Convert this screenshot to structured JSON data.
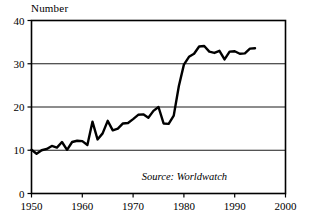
{
  "chart_data": {
    "type": "line",
    "title": "Number",
    "xlabel": "",
    "ylabel": "Number",
    "xlim": [
      1950,
      2000
    ],
    "ylim": [
      0,
      40
    ],
    "xticks": [
      1950,
      1960,
      1970,
      1980,
      1990,
      2000
    ],
    "yticks": [
      0,
      10,
      20,
      30,
      40
    ],
    "xtick_labels": [
      "1950",
      "1960",
      "1970",
      "1980",
      "1990",
      "2000"
    ],
    "ytick_labels": [
      "0",
      "10",
      "20",
      "30",
      "40"
    ],
    "grid": "horizontal",
    "legend": "none",
    "annotations": [
      {
        "name": "source-note",
        "text": "Source: Worldwatch",
        "x": 1988.5,
        "y": 3.2,
        "style": "italic"
      }
    ],
    "series": [
      {
        "name": "Number",
        "color": "#000000",
        "line_width": 2.4,
        "x": [
          1950,
          1951,
          1952,
          1953,
          1954,
          1955,
          1956,
          1957,
          1958,
          1959,
          1960,
          1961,
          1962,
          1963,
          1964,
          1965,
          1966,
          1967,
          1968,
          1969,
          1970,
          1971,
          1972,
          1973,
          1974,
          1975,
          1976,
          1977,
          1978,
          1979,
          1980,
          1981,
          1982,
          1983,
          1984,
          1985,
          1986,
          1987,
          1988,
          1989,
          1990,
          1991,
          1992,
          1993,
          1994
        ],
        "y": [
          10.1,
          9.2,
          10.0,
          10.3,
          11.0,
          10.6,
          11.9,
          10.1,
          11.9,
          12.2,
          12.1,
          11.2,
          16.6,
          12.5,
          13.9,
          16.8,
          14.6,
          15.0,
          16.2,
          16.3,
          17.2,
          18.2,
          18.3,
          17.5,
          19.1,
          20.0,
          16.2,
          16.1,
          18.0,
          24.8,
          29.8,
          31.6,
          32.3,
          34.0,
          34.1,
          32.8,
          32.5,
          33.0,
          31.0,
          32.8,
          32.9,
          32.3,
          32.4,
          33.5,
          33.6
        ]
      }
    ]
  }
}
